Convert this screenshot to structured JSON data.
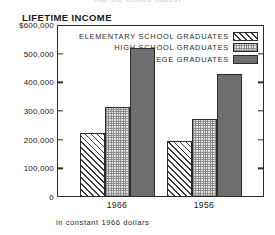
{
  "top_caption": "(for the United States)",
  "footnote": "in constant 1966 dollars",
  "axis": {
    "y_tick_labels": [
      "$600,000",
      "500,000",
      "400,000",
      "300,000",
      "200,000",
      "100,000",
      "0"
    ]
  },
  "legend": {
    "items": [
      {
        "label": "ELEMENTARY SCHOOL GRADUATES",
        "pattern": "diagonal-hatch"
      },
      {
        "label": "HIGH SCHOOL GRADUATES",
        "pattern": "cross-hatch"
      },
      {
        "label": "COLLEGE GRADUATES",
        "pattern": "solid-gray"
      }
    ]
  },
  "colors": {
    "axis": "#2b2b2b",
    "college_fill": "#6e6e6e",
    "highschool_fill": "#e9e9e9",
    "elementary_fill": "#ffffff"
  },
  "chart_data": {
    "type": "bar",
    "title": "LIFETIME INCOME",
    "subtitle": "in constant 1966 dollars",
    "xlabel": "",
    "ylabel": "",
    "categories": [
      "1966",
      "1956"
    ],
    "series": [
      {
        "name": "ELEMENTARY SCHOOL GRADUATES",
        "values": [
          225000,
          197000
        ]
      },
      {
        "name": "HIGH SCHOOL GRADUATES",
        "values": [
          315000,
          272000
        ]
      },
      {
        "name": "COLLEGE GRADUATES",
        "values": [
          520000,
          430000
        ]
      }
    ],
    "ylim": [
      0,
      600000
    ],
    "ytick_values": [
      600000,
      500000,
      400000,
      300000,
      200000,
      100000,
      0
    ],
    "grid": false,
    "legend_position": "top-right-inside"
  }
}
